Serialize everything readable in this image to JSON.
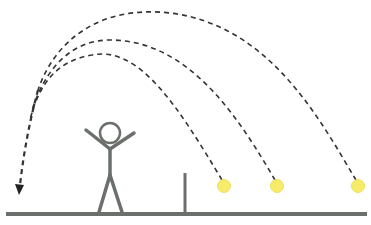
{
  "diagram": {
    "description": "Stick figure with arms raised stands on ground line; three yellow balls on the ground to the right of a short vertical post; dashed arcs from each ball converge and curve left with an arrowhead pointing down to the ground at far left.",
    "colors": {
      "background": "#ffffff",
      "ground": "#6b706c",
      "figure": "#6b706c",
      "post": "#6b706c",
      "ball_fill": "#f7ec6a",
      "ball_edge": "#eee060",
      "trajectory": "#333333"
    },
    "elements": {
      "ground": {
        "x1": 6,
        "y1": 214,
        "x2": 367,
        "y2": 214
      },
      "stick_figure": {
        "head_cx": 110,
        "head_cy": 133,
        "head_r": 10,
        "pose": "arms-raised"
      },
      "post": {
        "x": 185,
        "y_top": 173,
        "y_bottom": 214
      },
      "balls": [
        {
          "cx": 224,
          "cy": 186,
          "r": 6.5
        },
        {
          "cx": 277,
          "cy": 186,
          "r": 6.5
        },
        {
          "cx": 358,
          "cy": 186,
          "r": 6.5
        }
      ],
      "trajectories": [
        {
          "from_ball": 0,
          "peak_y": 52,
          "style": "dashed"
        },
        {
          "from_ball": 1,
          "peak_y": 40,
          "style": "dashed"
        },
        {
          "from_ball": 2,
          "peak_y": 13,
          "style": "dashed"
        }
      ],
      "arrow": {
        "tip_x": 19,
        "tip_y": 194,
        "direction": "down"
      }
    }
  }
}
